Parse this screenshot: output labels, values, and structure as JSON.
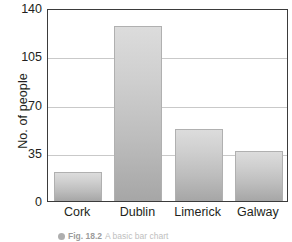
{
  "figure": {
    "caption_bullet_icon": "filled-circle-icon",
    "caption_number": "Fig. 18.2",
    "caption_text": "A basic bar chart"
  },
  "chart_data": {
    "type": "bar",
    "title": "",
    "xlabel": "",
    "ylabel": "No. of people",
    "categories": [
      "Cork",
      "Dublin",
      "Limerick",
      "Galway"
    ],
    "values": [
      21,
      127,
      52,
      36
    ],
    "ylim": [
      0,
      140
    ],
    "yticks": [
      0,
      35,
      70,
      105,
      140
    ],
    "ytick_labels": [
      "0",
      "35",
      "70",
      "105",
      "140"
    ],
    "grid": true,
    "legend": "none",
    "bar_color_top": "#dcdcdc",
    "bar_color_bottom": "#a6a6a6",
    "bar_border_color": "#b0b0b0",
    "gridline_color": "#c9c9c9",
    "frame_color": "#3b3b3b",
    "background": "#ffffff"
  }
}
